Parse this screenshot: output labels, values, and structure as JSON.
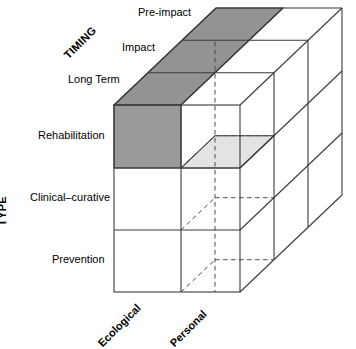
{
  "diagram": {
    "title_hidden": "",
    "axes": {
      "timing": {
        "label": "TIMING",
        "categories": [
          "Long Term",
          "Impact",
          "Pre-impact"
        ]
      },
      "type": {
        "label": "TYPE",
        "categories": [
          "Rehabilitation",
          "Clinical–curative",
          "Prevention"
        ]
      },
      "target": {
        "label": "",
        "categories": [
          "Ecological",
          "Personal"
        ]
      }
    },
    "timing_labels": {
      "pre_impact": "Pre-impact",
      "impact": "Impact",
      "long_term": "Long Term"
    },
    "type_labels": {
      "rehabilitation": "Rehabilitation",
      "clinical_curative": "Clinical–curative",
      "prevention": "Prevention"
    },
    "target_labels": {
      "ecological": "Ecological",
      "personal": "Personal"
    },
    "axis_titles": {
      "timing": "TIMING",
      "type": "TYPE"
    },
    "highlighted_cells": [
      {
        "name": "long-term-ecological-rehabilitation",
        "shade": "dark",
        "color": "#9a9a9a"
      },
      {
        "name": "long-term-personal-rehabilitation-interior",
        "shade": "light",
        "color": "#e2e2e2"
      }
    ],
    "colors": {
      "stroke": "#3a3a3a",
      "dark_cell": "#9a9a9a",
      "dark_cell_top": "#8e8e8e",
      "light_cell": "#e3e3e3",
      "face": "#ffffff",
      "dashed": "#4a4a4a",
      "text": "#000000"
    },
    "geometry": {
      "front_left_x": 114,
      "front_right_x": 240,
      "front_top_y": 105,
      "front_bottom_y": 292,
      "col_divider_x": 181,
      "row_lines_y": [
        105,
        168,
        230,
        292
      ],
      "depth_dx": 34,
      "depth_dy": -32.3,
      "depth_slices": 3
    }
  }
}
